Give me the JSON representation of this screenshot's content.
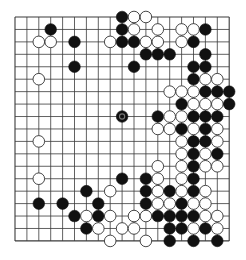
{
  "board": {
    "size": 19,
    "origin_x": 15,
    "origin_y": 17,
    "spacing_x": 11.9,
    "spacing_y": 12.44,
    "stone_radius": 5.8,
    "colors": {
      "background": "#ffffff",
      "grid": "#3a3a3a",
      "black_stone": "#111111",
      "white_stone": "#ffffff",
      "white_outline": "#333333",
      "marker": "#777777"
    },
    "last_move": {
      "col": 9,
      "row": 8,
      "color": "black"
    },
    "stones": [
      {
        "row": 0,
        "col": 9,
        "color": "black"
      },
      {
        "row": 0,
        "col": 10,
        "color": "white"
      },
      {
        "row": 0,
        "col": 11,
        "color": "white"
      },
      {
        "row": 1,
        "col": 3,
        "color": "black"
      },
      {
        "row": 1,
        "col": 9,
        "color": "black"
      },
      {
        "row": 1,
        "col": 10,
        "color": "white"
      },
      {
        "row": 1,
        "col": 12,
        "color": "white"
      },
      {
        "row": 1,
        "col": 14,
        "color": "white"
      },
      {
        "row": 1,
        "col": 15,
        "color": "white"
      },
      {
        "row": 1,
        "col": 16,
        "color": "black"
      },
      {
        "row": 2,
        "col": 2,
        "color": "white"
      },
      {
        "row": 2,
        "col": 3,
        "color": "white"
      },
      {
        "row": 2,
        "col": 5,
        "color": "black"
      },
      {
        "row": 2,
        "col": 8,
        "color": "white"
      },
      {
        "row": 2,
        "col": 9,
        "color": "black"
      },
      {
        "row": 2,
        "col": 10,
        "color": "black"
      },
      {
        "row": 2,
        "col": 11,
        "color": "white"
      },
      {
        "row": 2,
        "col": 12,
        "color": "white"
      },
      {
        "row": 2,
        "col": 14,
        "color": "white"
      },
      {
        "row": 2,
        "col": 15,
        "color": "black"
      },
      {
        "row": 3,
        "col": 11,
        "color": "black"
      },
      {
        "row": 3,
        "col": 12,
        "color": "black"
      },
      {
        "row": 3,
        "col": 13,
        "color": "black"
      },
      {
        "row": 3,
        "col": 16,
        "color": "black"
      },
      {
        "row": 4,
        "col": 5,
        "color": "black"
      },
      {
        "row": 4,
        "col": 10,
        "color": "black"
      },
      {
        "row": 4,
        "col": 15,
        "color": "black"
      },
      {
        "row": 4,
        "col": 16,
        "color": "black"
      },
      {
        "row": 5,
        "col": 2,
        "color": "white"
      },
      {
        "row": 5,
        "col": 15,
        "color": "black"
      },
      {
        "row": 5,
        "col": 16,
        "color": "white"
      },
      {
        "row": 5,
        "col": 17,
        "color": "white"
      },
      {
        "row": 6,
        "col": 13,
        "color": "white"
      },
      {
        "row": 6,
        "col": 14,
        "color": "white"
      },
      {
        "row": 6,
        "col": 15,
        "color": "white"
      },
      {
        "row": 6,
        "col": 16,
        "color": "black"
      },
      {
        "row": 6,
        "col": 17,
        "color": "black"
      },
      {
        "row": 6,
        "col": 18,
        "color": "black"
      },
      {
        "row": 7,
        "col": 14,
        "color": "black"
      },
      {
        "row": 7,
        "col": 15,
        "color": "white"
      },
      {
        "row": 7,
        "col": 16,
        "color": "white"
      },
      {
        "row": 7,
        "col": 17,
        "color": "white"
      },
      {
        "row": 7,
        "col": 18,
        "color": "black"
      },
      {
        "row": 8,
        "col": 9,
        "color": "black"
      },
      {
        "row": 8,
        "col": 12,
        "color": "black"
      },
      {
        "row": 8,
        "col": 13,
        "color": "white"
      },
      {
        "row": 8,
        "col": 14,
        "color": "white"
      },
      {
        "row": 8,
        "col": 15,
        "color": "black"
      },
      {
        "row": 8,
        "col": 16,
        "color": "black"
      },
      {
        "row": 8,
        "col": 17,
        "color": "black"
      },
      {
        "row": 9,
        "col": 12,
        "color": "white"
      },
      {
        "row": 9,
        "col": 13,
        "color": "white"
      },
      {
        "row": 9,
        "col": 14,
        "color": "black"
      },
      {
        "row": 9,
        "col": 15,
        "color": "white"
      },
      {
        "row": 9,
        "col": 16,
        "color": "black"
      },
      {
        "row": 9,
        "col": 17,
        "color": "white"
      },
      {
        "row": 10,
        "col": 2,
        "color": "white"
      },
      {
        "row": 10,
        "col": 14,
        "color": "white"
      },
      {
        "row": 10,
        "col": 15,
        "color": "black"
      },
      {
        "row": 10,
        "col": 16,
        "color": "black"
      },
      {
        "row": 10,
        "col": 17,
        "color": "white"
      },
      {
        "row": 11,
        "col": 14,
        "color": "white"
      },
      {
        "row": 11,
        "col": 15,
        "color": "black"
      },
      {
        "row": 11,
        "col": 16,
        "color": "white"
      },
      {
        "row": 11,
        "col": 17,
        "color": "black"
      },
      {
        "row": 12,
        "col": 12,
        "color": "white"
      },
      {
        "row": 12,
        "col": 14,
        "color": "white"
      },
      {
        "row": 12,
        "col": 15,
        "color": "black"
      },
      {
        "row": 12,
        "col": 16,
        "color": "white"
      },
      {
        "row": 12,
        "col": 17,
        "color": "white"
      },
      {
        "row": 13,
        "col": 2,
        "color": "white"
      },
      {
        "row": 13,
        "col": 9,
        "color": "black"
      },
      {
        "row": 13,
        "col": 11,
        "color": "black"
      },
      {
        "row": 13,
        "col": 12,
        "color": "white"
      },
      {
        "row": 13,
        "col": 14,
        "color": "white"
      },
      {
        "row": 13,
        "col": 15,
        "color": "black"
      },
      {
        "row": 14,
        "col": 6,
        "color": "black"
      },
      {
        "row": 14,
        "col": 8,
        "color": "white"
      },
      {
        "row": 14,
        "col": 11,
        "color": "black"
      },
      {
        "row": 14,
        "col": 12,
        "color": "white"
      },
      {
        "row": 14,
        "col": 13,
        "color": "black"
      },
      {
        "row": 14,
        "col": 14,
        "color": "white"
      },
      {
        "row": 14,
        "col": 15,
        "color": "black"
      },
      {
        "row": 14,
        "col": 16,
        "color": "white"
      },
      {
        "row": 15,
        "col": 2,
        "color": "black"
      },
      {
        "row": 15,
        "col": 4,
        "color": "black"
      },
      {
        "row": 15,
        "col": 7,
        "color": "black"
      },
      {
        "row": 15,
        "col": 11,
        "color": "black"
      },
      {
        "row": 15,
        "col": 12,
        "color": "white"
      },
      {
        "row": 15,
        "col": 13,
        "color": "white"
      },
      {
        "row": 15,
        "col": 14,
        "color": "black"
      },
      {
        "row": 15,
        "col": 15,
        "color": "white"
      },
      {
        "row": 15,
        "col": 16,
        "color": "white"
      },
      {
        "row": 16,
        "col": 5,
        "color": "black"
      },
      {
        "row": 16,
        "col": 6,
        "color": "white"
      },
      {
        "row": 16,
        "col": 7,
        "color": "black"
      },
      {
        "row": 16,
        "col": 8,
        "color": "white"
      },
      {
        "row": 16,
        "col": 10,
        "color": "white"
      },
      {
        "row": 16,
        "col": 11,
        "color": "white"
      },
      {
        "row": 16,
        "col": 12,
        "color": "black"
      },
      {
        "row": 16,
        "col": 13,
        "color": "black"
      },
      {
        "row": 16,
        "col": 14,
        "color": "black"
      },
      {
        "row": 16,
        "col": 15,
        "color": "black"
      },
      {
        "row": 16,
        "col": 16,
        "color": "white"
      },
      {
        "row": 16,
        "col": 17,
        "color": "white"
      },
      {
        "row": 17,
        "col": 6,
        "color": "black"
      },
      {
        "row": 17,
        "col": 7,
        "color": "white"
      },
      {
        "row": 17,
        "col": 9,
        "color": "white"
      },
      {
        "row": 17,
        "col": 10,
        "color": "white"
      },
      {
        "row": 17,
        "col": 13,
        "color": "black"
      },
      {
        "row": 17,
        "col": 14,
        "color": "black"
      },
      {
        "row": 17,
        "col": 15,
        "color": "white"
      },
      {
        "row": 17,
        "col": 16,
        "color": "black"
      },
      {
        "row": 17,
        "col": 17,
        "color": "white"
      },
      {
        "row": 18,
        "col": 8,
        "color": "white"
      },
      {
        "row": 18,
        "col": 11,
        "color": "white"
      },
      {
        "row": 18,
        "col": 13,
        "color": "black"
      },
      {
        "row": 18,
        "col": 15,
        "color": "black"
      },
      {
        "row": 18,
        "col": 17,
        "color": "black"
      }
    ]
  }
}
